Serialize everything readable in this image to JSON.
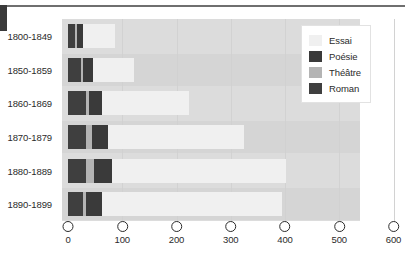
{
  "chart_data": {
    "type": "bar",
    "orientation": "horizontal",
    "stacked": true,
    "title": "",
    "xlabel": "",
    "ylabel": "",
    "xlim": [
      0,
      600
    ],
    "xticks": [
      0,
      100,
      200,
      300,
      400,
      500,
      600
    ],
    "grid": true,
    "legend_position": "top-right",
    "categories": [
      "1800-1849",
      "1850-1859",
      "1860-1869",
      "1870-1879",
      "1880-1889",
      "1890-1899"
    ],
    "series": [
      {
        "name": "Roman",
        "color": "#3f3f3f",
        "values": [
          12,
          24,
          34,
          34,
          34,
          28
        ]
      },
      {
        "name": "Théâtre",
        "color": "#b4b4b4",
        "values": [
          4,
          4,
          4,
          10,
          14,
          6
        ]
      },
      {
        "name": "Poésie",
        "color": "#3a3a3a",
        "values": [
          12,
          18,
          24,
          30,
          34,
          28
        ]
      },
      {
        "name": "Essai",
        "color": "#f0f0f0",
        "values": [
          58,
          76,
          162,
          250,
          320,
          332
        ]
      }
    ],
    "totals": [
      86,
      122,
      224,
      324,
      402,
      394
    ],
    "stack_order": [
      "Roman",
      "Théâtre",
      "Poésie",
      "Essai"
    ]
  },
  "legend": {
    "items": [
      {
        "label": "Essai",
        "swatch": "essai"
      },
      {
        "label": "Poésie",
        "swatch": "poesie"
      },
      {
        "label": "Théâtre",
        "swatch": "theatre"
      },
      {
        "label": "Roman",
        "swatch": "roman"
      }
    ]
  }
}
